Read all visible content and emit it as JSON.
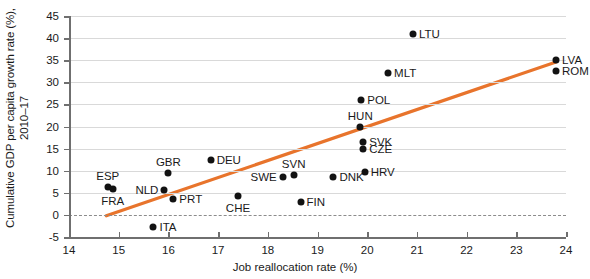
{
  "chart_data": {
    "type": "scatter",
    "title": "",
    "xlabel": "Job reallocation rate (%)",
    "ylabel": "Cumulative GDP per capita growth rate (%), 2010–17",
    "xlim": [
      14,
      24
    ],
    "ylim": [
      -5,
      45
    ],
    "xticks": [
      14,
      15,
      16,
      17,
      18,
      19,
      20,
      21,
      22,
      23,
      24
    ],
    "yticks": [
      -5,
      0,
      5,
      10,
      15,
      20,
      25,
      30,
      35,
      40,
      45
    ],
    "xtick_labels": [
      "14",
      "15",
      "16",
      "17",
      "18",
      "19",
      "20",
      "21",
      "22",
      "23",
      "24"
    ],
    "ytick_labels": [
      "-5",
      "0",
      "5",
      "10",
      "15",
      "20",
      "25",
      "30",
      "35",
      "40",
      "45"
    ],
    "grid": true,
    "grid_axis": "y",
    "legend": "none",
    "zero_reference_line": 0,
    "marker_color": "#121212",
    "trendline_color": "#e8742c",
    "gridline_color": "#d9d9d9",
    "axis_color": "#6f6f6f",
    "trendline": {
      "type": "linear-fit",
      "x_start": 14.75,
      "y_start": -0.2,
      "x_end": 23.8,
      "y_end": 34.6
    },
    "points": [
      {
        "label": "ESP",
        "x": 14.78,
        "y": 6.3,
        "label_pos": "above"
      },
      {
        "label": "FRA",
        "x": 14.88,
        "y": 5.9,
        "label_pos": "below"
      },
      {
        "label": "ITA",
        "x": 15.7,
        "y": -2.8,
        "label_pos": "right"
      },
      {
        "label": "NLD",
        "x": 15.92,
        "y": 5.7,
        "label_pos": "left"
      },
      {
        "label": "GBR",
        "x": 16.0,
        "y": 9.5,
        "label_pos": "above"
      },
      {
        "label": "PRT",
        "x": 16.1,
        "y": 3.7,
        "label_pos": "right"
      },
      {
        "label": "DEU",
        "x": 16.85,
        "y": 12.5,
        "label_pos": "right"
      },
      {
        "label": "CHE",
        "x": 17.4,
        "y": 4.2,
        "label_pos": "below"
      },
      {
        "label": "SWE",
        "x": 18.3,
        "y": 8.5,
        "label_pos": "left"
      },
      {
        "label": "SVN",
        "x": 18.52,
        "y": 9.0,
        "label_pos": "above"
      },
      {
        "label": "FIN",
        "x": 18.66,
        "y": 3.0,
        "label_pos": "right"
      },
      {
        "label": "DNK",
        "x": 19.32,
        "y": 8.5,
        "label_pos": "right"
      },
      {
        "label": "HRV",
        "x": 19.95,
        "y": 9.8,
        "label_pos": "right"
      },
      {
        "label": "CZE",
        "x": 19.92,
        "y": 15.0,
        "label_pos": "right"
      },
      {
        "label": "SVK",
        "x": 19.92,
        "y": 16.6,
        "label_pos": "right"
      },
      {
        "label": "HUN",
        "x": 19.86,
        "y": 20.0,
        "label_pos": "above"
      },
      {
        "label": "POL",
        "x": 19.88,
        "y": 26.0,
        "label_pos": "right"
      },
      {
        "label": "MLT",
        "x": 20.42,
        "y": 32.0,
        "label_pos": "right"
      },
      {
        "label": "LTU",
        "x": 20.92,
        "y": 41.0,
        "label_pos": "right"
      },
      {
        "label": "LVA",
        "x": 23.8,
        "y": 35.0,
        "label_pos": "right"
      },
      {
        "label": "ROM",
        "x": 23.8,
        "y": 32.5,
        "label_pos": "right"
      }
    ]
  }
}
